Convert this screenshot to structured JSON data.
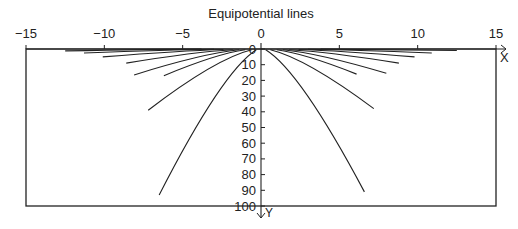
{
  "chart_data": {
    "type": "line",
    "title": "Equipotential lines",
    "xlabel": "X",
    "ylabel": "Y",
    "xlim": [
      -15,
      15
    ],
    "ylim": [
      0,
      100
    ],
    "y_inverted": true,
    "x_ticks": [
      "−15",
      "−10",
      "−5",
      "0",
      "5",
      "10",
      "15"
    ],
    "x_tick_values": [
      -15,
      -10,
      -5,
      0,
      5,
      10,
      15
    ],
    "y_ticks": [
      "0",
      "10",
      "20",
      "30",
      "40",
      "50",
      "60",
      "70",
      "80",
      "90",
      "100"
    ],
    "y_tick_values": [
      0,
      10,
      20,
      30,
      40,
      50,
      60,
      70,
      80,
      90,
      100
    ],
    "grid": false,
    "series": [
      {
        "name": "left-1",
        "points": [
          [
            -0.3,
            0.5
          ],
          [
            -6.5,
            93
          ]
        ]
      },
      {
        "name": "left-2",
        "points": [
          [
            -0.6,
            0.5
          ],
          [
            -7.2,
            39
          ]
        ]
      },
      {
        "name": "left-3",
        "points": [
          [
            -1.0,
            0.5
          ],
          [
            -6.2,
            17
          ]
        ]
      },
      {
        "name": "left-4",
        "points": [
          [
            -1.4,
            0.5
          ],
          [
            -8.1,
            16.5
          ]
        ]
      },
      {
        "name": "left-5",
        "points": [
          [
            -1.8,
            0.5
          ],
          [
            -8.6,
            9
          ]
        ]
      },
      {
        "name": "left-6",
        "points": [
          [
            -2.4,
            0.3
          ],
          [
            -10.1,
            5
          ]
        ]
      },
      {
        "name": "left-7",
        "points": [
          [
            -3.0,
            0.2
          ],
          [
            -11.3,
            2.5
          ]
        ]
      },
      {
        "name": "left-8",
        "points": [
          [
            -3.8,
            0.1
          ],
          [
            -12.5,
            1.2
          ]
        ]
      },
      {
        "name": "right-1",
        "points": [
          [
            0.3,
            0.5
          ],
          [
            6.6,
            91
          ]
        ]
      },
      {
        "name": "right-2",
        "points": [
          [
            0.6,
            0.5
          ],
          [
            7.2,
            38
          ]
        ]
      },
      {
        "name": "right-3",
        "points": [
          [
            1.0,
            0.5
          ],
          [
            6.1,
            16
          ]
        ]
      },
      {
        "name": "right-4",
        "points": [
          [
            1.4,
            0.5
          ],
          [
            8.0,
            15.5
          ]
        ]
      },
      {
        "name": "right-5",
        "points": [
          [
            1.8,
            0.5
          ],
          [
            8.8,
            9
          ]
        ]
      },
      {
        "name": "right-6",
        "points": [
          [
            2.4,
            0.3
          ],
          [
            9.8,
            5
          ]
        ]
      },
      {
        "name": "right-7",
        "points": [
          [
            3.0,
            0.2
          ],
          [
            10.9,
            2.5
          ]
        ]
      },
      {
        "name": "right-8",
        "points": [
          [
            3.8,
            0.1
          ],
          [
            12.5,
            1
          ]
        ]
      }
    ]
  }
}
